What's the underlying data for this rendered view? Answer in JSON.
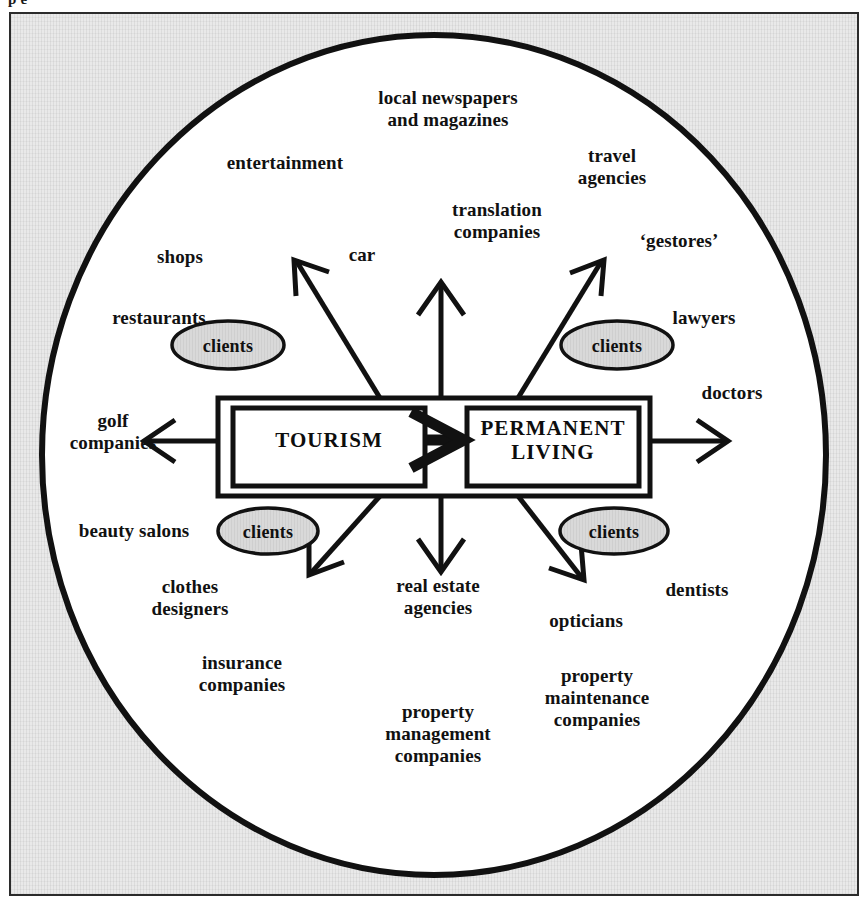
{
  "page": {
    "top_clipped_text": "p                              e",
    "width": 868,
    "height": 906
  },
  "colors": {
    "plate_background": "#e9e9e9",
    "circle_fill": "#ffffff",
    "stroke": "#111111",
    "ellipse_fill": "#d9d9d9",
    "text": "#111111"
  },
  "core": {
    "left_box_label": "TOURISM",
    "right_box_label": "PERMANENT\nLIVING",
    "center_arrow_name": "tourism-to-permanent-living-arrow"
  },
  "clients_nodes": [
    {
      "id": "clients-top-left",
      "label": "clients"
    },
    {
      "id": "clients-top-right",
      "label": "clients"
    },
    {
      "id": "clients-bottom-left",
      "label": "clients"
    },
    {
      "id": "clients-bottom-right",
      "label": "clients"
    }
  ],
  "labels": [
    {
      "id": "local-newspapers-and-magazines",
      "text": "local newspapers\nand magazines",
      "x": 448,
      "y": 109
    },
    {
      "id": "entertainment",
      "text": "entertainment",
      "x": 285,
      "y": 163
    },
    {
      "id": "travel-agencies",
      "text": "travel\nagencies",
      "x": 612,
      "y": 167
    },
    {
      "id": "translation-companies",
      "text": "translation\ncompanies",
      "x": 497,
      "y": 221
    },
    {
      "id": "gestores",
      "text": "‘gestores’",
      "x": 679,
      "y": 241
    },
    {
      "id": "shops",
      "text": "shops",
      "x": 180,
      "y": 257
    },
    {
      "id": "car",
      "text": "car",
      "x": 362,
      "y": 255
    },
    {
      "id": "restaurants",
      "text": "restaurants",
      "x": 159,
      "y": 318
    },
    {
      "id": "lawyers",
      "text": "lawyers",
      "x": 704,
      "y": 318
    },
    {
      "id": "doctors",
      "text": "doctors",
      "x": 732,
      "y": 393
    },
    {
      "id": "golf-companies",
      "text": "golf\ncompanies",
      "x": 113,
      "y": 432
    },
    {
      "id": "beauty-salons",
      "text": "beauty salons",
      "x": 134,
      "y": 531
    },
    {
      "id": "clothes-designers",
      "text": "clothes\ndesigners",
      "x": 190,
      "y": 598
    },
    {
      "id": "real-estate-agencies",
      "text": "real estate\nagencies",
      "x": 438,
      "y": 597
    },
    {
      "id": "opticians",
      "text": "opticians",
      "x": 586,
      "y": 621
    },
    {
      "id": "dentists",
      "text": "dentists",
      "x": 697,
      "y": 590
    },
    {
      "id": "insurance-companies",
      "text": "insurance\ncompanies",
      "x": 242,
      "y": 674
    },
    {
      "id": "property-maintenance-companies",
      "text": "property\nmaintenance\ncompanies",
      "x": 597,
      "y": 698
    },
    {
      "id": "property-management-companies",
      "text": "property\nmanagement\ncompanies",
      "x": 438,
      "y": 734
    }
  ]
}
